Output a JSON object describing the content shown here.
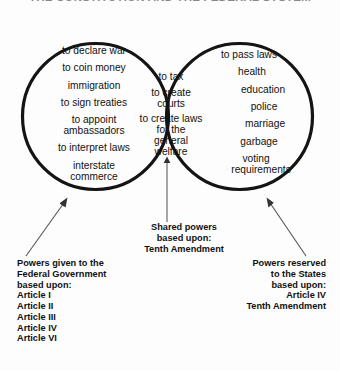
{
  "title": "THE CONSTITUTION AND THE FEDERAL SYSTEM",
  "diagram": {
    "type": "venn",
    "sets": 2,
    "stroke_color": "#111111",
    "background": "#fdfdfd"
  },
  "left_circle": {
    "name": "powers-given-to-federal-government",
    "items": [
      "to declare war",
      "to coin money",
      "immigration",
      "to sign treaties",
      "to appoint",
      "ambassadors",
      "to interpret  laws",
      "interstate",
      "commerce"
    ]
  },
  "center_overlap": {
    "name": "shared-powers",
    "items": [
      "to tax",
      "to create",
      "courts",
      "to create laws",
      "for the",
      "general",
      "welfare"
    ]
  },
  "right_circle": {
    "name": "powers-reserved-to-the-states",
    "items": [
      "to pass laws",
      "health",
      "education",
      "police",
      "marriage",
      "garbage",
      "voting",
      "requirements"
    ]
  },
  "captions": {
    "shared": [
      "Shared powers",
      "based upon:",
      "Tenth Amendment"
    ],
    "federal": [
      "Powers given to the",
      "Federal Government",
      "based upon:",
      "Article I",
      "Article II",
      "Article III",
      "Article IV",
      "Article VI"
    ],
    "states": [
      "Powers reserved",
      "to the States",
      "based upon:",
      "Article IV",
      "Tenth Amendment"
    ]
  },
  "arrows": {
    "federal": "arrow pointing up-right into the left circle",
    "shared": "arrow pointing up into the overlap lens",
    "states": "arrow pointing up-left into the right circle"
  }
}
